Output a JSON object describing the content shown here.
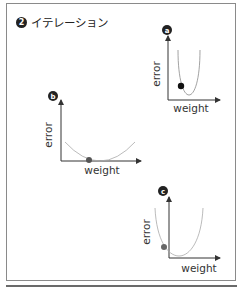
{
  "title": {
    "step_number": "2",
    "text": "イテレーション"
  },
  "panels": [
    {
      "id": "a",
      "badge": "a",
      "x_label": "weight",
      "y_label": "error",
      "curve": "narrow parabola",
      "point": "on left wall of curve, above minimum",
      "point_color": "#111111"
    },
    {
      "id": "b",
      "badge": "b",
      "x_label": "weight",
      "y_label": "error",
      "curve": "wide shallow parabola",
      "point": "near minimum",
      "point_color": "#555555"
    },
    {
      "id": "c",
      "badge": "c",
      "x_label": "weight",
      "y_label": "error",
      "curve": "parabola offset left of y-axis",
      "point": "left of y-axis near bottom",
      "point_color": "#666666"
    }
  ],
  "colors": {
    "axis": "#333333",
    "curve": "#8a8a8a",
    "frame": "#8a8a8a",
    "text": "#222222"
  }
}
